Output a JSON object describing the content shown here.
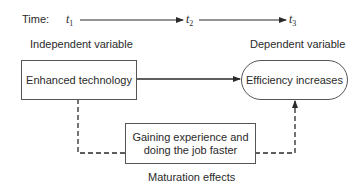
{
  "timeline": {
    "label": "Time:",
    "points": [
      {
        "symbol": "t",
        "sub": "1"
      },
      {
        "symbol": "t",
        "sub": "2"
      },
      {
        "symbol": "t",
        "sub": "3"
      }
    ]
  },
  "headers": {
    "independent": "Independent variable",
    "dependent": "Dependent variable"
  },
  "boxes": {
    "cause": "Enhanced technology",
    "effect": "Efficiency increases",
    "confound_line1": "Gaining experience and",
    "confound_line2": "doing the job faster"
  },
  "caption": "Maturation effects",
  "colors": {
    "line": "#2a2a2a",
    "box_border": "#555555",
    "text": "#2a2a2a"
  }
}
